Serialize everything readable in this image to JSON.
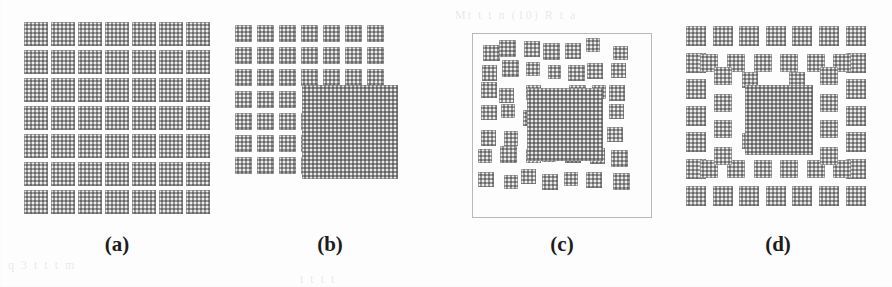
{
  "figure": {
    "background_color": "#fdfdfd",
    "square_fill_color": "#9a9a9a",
    "square_edge_color": "#6e6e6e",
    "frame_color": "#b9b9b9",
    "caption_color": "#1c1c1c",
    "ghost_text": [
      {
        "text": "Mt t t n (10) R t a",
        "x": 455,
        "y": 8
      },
      {
        "text": "q 3  t   t    t  m",
        "x": 8,
        "y": 258
      },
      {
        "text": "t t   t t",
        "x": 300,
        "y": 272
      }
    ]
  },
  "panels": [
    {
      "id": "a",
      "caption": "(a)",
      "description": "Uniform 7 x 7 array of equal squares (generator, level 0)",
      "box": {
        "x": 22,
        "y": 20,
        "w": 190,
        "h": 196
      },
      "caption_box": {
        "x": 67,
        "y": 232
      },
      "has_frame": false,
      "grid": {
        "cols": 7,
        "rows": 7
      },
      "cell": {
        "w": 27.1,
        "h": 28.0,
        "pad": 3.2
      },
      "square_count": 49
    },
    {
      "id": "b",
      "caption": "(b)",
      "description": "Sierpinski-carpet style lattice: 3x3 corner blocks, 1x3 edge strips, one large central square",
      "box": {
        "x": 232,
        "y": 22,
        "w": 196,
        "h": 196
      },
      "caption_box": {
        "x": 280,
        "y": 232
      },
      "has_frame": false,
      "center_square": {
        "x": 70,
        "y": 63,
        "w": 96,
        "h": 94
      },
      "unit": 22.0,
      "small_size": 17.0,
      "square_count": 41
    },
    {
      "id": "c",
      "caption": "(c)",
      "description": "Randomly jittered (disordered) carpet: same square population with random positional offsets, enclosed in a thin frame",
      "box": {
        "x": 472,
        "y": 33,
        "w": 180,
        "h": 185
      },
      "caption_box": {
        "x": 512,
        "y": 232
      },
      "has_frame": true,
      "center_square": {
        "x": 55,
        "y": 55,
        "w": 76,
        "h": 73
      },
      "square_count": 44
    },
    {
      "id": "d",
      "caption": "(d)",
      "description": "Staggered / offset brick carpet: alternating rings of squares around a large central square",
      "box": {
        "x": 685,
        "y": 25,
        "w": 186,
        "h": 192
      },
      "caption_box": {
        "x": 728,
        "y": 232
      },
      "has_frame": false,
      "center_square": {
        "x": 60,
        "y": 60,
        "w": 68,
        "h": 70
      },
      "square_count": 48
    }
  ]
}
